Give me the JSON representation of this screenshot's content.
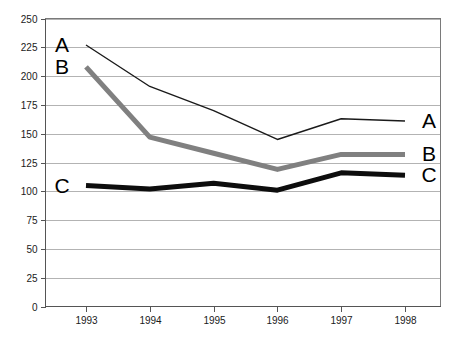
{
  "chart_data": {
    "type": "line",
    "title": "",
    "subtitle": "",
    "xlabel": "",
    "ylabel": "",
    "categories": [
      "1993",
      "1994",
      "1995",
      "1996",
      "1997",
      "1998"
    ],
    "x": [
      1993,
      1994,
      1995,
      1996,
      1997,
      1998
    ],
    "ylim": [
      0,
      250
    ],
    "yticks": [
      0,
      25,
      50,
      75,
      100,
      125,
      150,
      175,
      200,
      225,
      250
    ],
    "ytick_labels": [
      "0",
      "25",
      "50",
      "75",
      "100",
      "125",
      "150",
      "175",
      "200",
      "225",
      "250"
    ],
    "grid": true,
    "grid_axis": "y",
    "legend": "inline-end-labels",
    "series": [
      {
        "name": "A",
        "label_left": "A",
        "label_right": "A",
        "color": "#1a1a1a",
        "width": 1.4,
        "values": [
          227,
          191,
          170,
          145,
          163,
          161
        ]
      },
      {
        "name": "B",
        "label_left": "B",
        "label_right": "B",
        "color": "#808080",
        "width": 5,
        "values": [
          208,
          147,
          133,
          119,
          132,
          132
        ]
      },
      {
        "name": "C",
        "label_left": "C",
        "label_right": "C",
        "color": "#0d0d0d",
        "width": 5,
        "values": [
          105,
          102,
          107,
          101,
          116,
          114
        ]
      }
    ],
    "colors": {
      "series_a": "#1a1a1a",
      "series_b": "#808080",
      "series_c": "#0d0d0d",
      "gridline": "#b3b3b3",
      "border": "#7a7a7a",
      "background": "#ffffff",
      "text": "#1a1a1a"
    }
  }
}
